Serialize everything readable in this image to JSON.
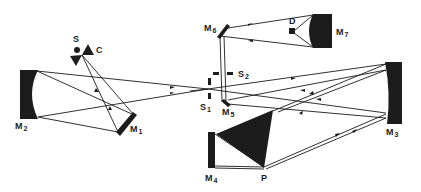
{
  "diagram": {
    "type": "optical-spectrometer-layout",
    "colors": {
      "ink": "#1c1c1c",
      "background": "#ffffff"
    },
    "components": [
      {
        "id": "S",
        "label": "S",
        "sub": "",
        "role": "source"
      },
      {
        "id": "C",
        "label": "C",
        "sub": "",
        "role": "chopper"
      },
      {
        "id": "M1",
        "label": "M",
        "sub": "1",
        "role": "plane mirror"
      },
      {
        "id": "M2",
        "label": "M",
        "sub": "2",
        "role": "concave mirror"
      },
      {
        "id": "S1",
        "label": "S",
        "sub": "1",
        "role": "entrance slit"
      },
      {
        "id": "S2",
        "label": "S",
        "sub": "2",
        "role": "exit slit"
      },
      {
        "id": "M3",
        "label": "M",
        "sub": "3",
        "role": "collimating mirror"
      },
      {
        "id": "M4",
        "label": "M",
        "sub": "4",
        "role": "Littrow mirror"
      },
      {
        "id": "P",
        "label": "P",
        "sub": "",
        "role": "prism"
      },
      {
        "id": "M5",
        "label": "M",
        "sub": "5",
        "role": "plane mirror"
      },
      {
        "id": "M6",
        "label": "M",
        "sub": "6",
        "role": "plane mirror"
      },
      {
        "id": "M7",
        "label": "M",
        "sub": "7",
        "role": "ellipsoidal mirror"
      },
      {
        "id": "D",
        "label": "D",
        "sub": "",
        "role": "detector"
      }
    ]
  }
}
